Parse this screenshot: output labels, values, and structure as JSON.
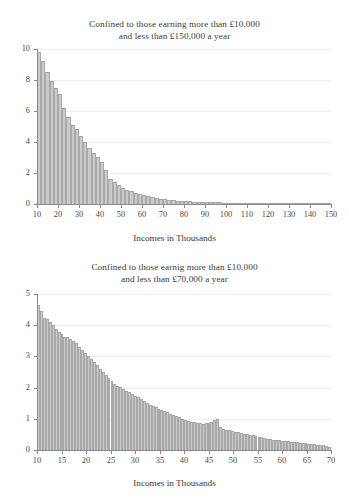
{
  "page": {
    "background": "#ffffff",
    "bar_fill": "#cbcbcb",
    "bar_edge": "#a3a3a3",
    "axis_color": "#8a8a8a",
    "grid_color": "#ededed",
    "text_color": "#3a3a3a"
  },
  "chart_data": [
    {
      "id": "income-histogram-150k",
      "type": "bar",
      "title": "Confined to those earning more than £10,000 and less than £150,000 a year",
      "title_lines": [
        "Confined to those earning more than £10,000",
        "and less than £150,000 a year"
      ],
      "xlabel": "Incomes in Thousands",
      "ylabel": "",
      "xlim": [
        10,
        150
      ],
      "ylim": [
        0,
        10
      ],
      "xticks": [
        10,
        20,
        30,
        40,
        50,
        60,
        70,
        80,
        90,
        100,
        110,
        120,
        130,
        140,
        150
      ],
      "xtick_labels": [
        "10",
        "20",
        "30",
        "40",
        "50",
        "60",
        "70",
        "80",
        "90",
        "100",
        "110",
        "120",
        "130",
        "140",
        "150"
      ],
      "yticks": [
        0,
        2,
        4,
        6,
        8,
        10
      ],
      "ytick_labels": [
        "0",
        "2",
        "4",
        "6",
        "8",
        "10"
      ],
      "grid": "horizontal",
      "legend": "none",
      "bin_width": 2,
      "bin_starts": [
        10,
        12,
        14,
        16,
        18,
        20,
        22,
        24,
        26,
        28,
        30,
        32,
        34,
        36,
        38,
        40,
        42,
        44,
        46,
        48,
        50,
        52,
        54,
        56,
        58,
        60,
        62,
        64,
        66,
        68,
        70,
        72,
        74,
        76,
        78,
        80,
        82,
        84,
        86,
        88,
        90,
        92,
        94,
        96,
        98,
        100,
        102,
        104,
        106,
        108,
        110,
        112,
        114,
        116,
        118,
        120,
        122,
        124,
        126,
        128,
        130,
        132,
        134,
        136,
        138,
        140,
        142,
        144,
        146,
        148
      ],
      "values": [
        9.8,
        9.2,
        8.5,
        7.9,
        7.5,
        7.1,
        6.2,
        5.6,
        5.1,
        4.8,
        4.4,
        4.0,
        3.6,
        3.3,
        3.0,
        2.7,
        2.2,
        1.6,
        1.4,
        1.2,
        1.05,
        0.92,
        0.8,
        0.7,
        0.62,
        0.55,
        0.48,
        0.43,
        0.38,
        0.34,
        0.3,
        0.27,
        0.24,
        0.21,
        0.19,
        0.17,
        0.155,
        0.14,
        0.13,
        0.12,
        0.11,
        0.1,
        0.092,
        0.085,
        0.078,
        0.072,
        0.066,
        0.061,
        0.057,
        0.053,
        0.049,
        0.045,
        0.042,
        0.039,
        0.036,
        0.034,
        0.031,
        0.029,
        0.027,
        0.025,
        0.023,
        0.022,
        0.02,
        0.019,
        0.018,
        0.017,
        0.016,
        0.015,
        0.014,
        0.013
      ],
      "annotation": "Spike near £42,000 reflecting the higher-rate tax threshold"
    },
    {
      "id": "income-histogram-70k",
      "type": "bar",
      "title": "Confined to those earnig more than £10,000 and less than £70,000 a year",
      "title_lines": [
        "Confined to those earnig more than £10,000",
        "and less than £70,000 a year"
      ],
      "xlabel": "Incomes in Thousands",
      "ylabel": "",
      "xlim": [
        10,
        70
      ],
      "ylim": [
        0,
        5
      ],
      "xticks": [
        10,
        15,
        20,
        25,
        30,
        35,
        40,
        45,
        50,
        55,
        60,
        65,
        70
      ],
      "xtick_labels": [
        "10",
        "15",
        "20",
        "25",
        "30",
        "35",
        "40",
        "45",
        "50",
        "55",
        "60",
        "65",
        "70"
      ],
      "yticks": [
        0,
        1,
        2,
        3,
        4,
        5
      ],
      "ytick_labels": [
        "0",
        "1",
        "2",
        "3",
        "4",
        "5"
      ],
      "grid": "horizontal",
      "legend": "none",
      "bin_width": 0.6,
      "bin_starts": [
        10.0,
        10.6,
        11.2,
        11.8,
        12.4,
        13.0,
        13.6,
        14.2,
        14.8,
        15.4,
        16.0,
        16.6,
        17.2,
        17.8,
        18.4,
        19.0,
        19.6,
        20.2,
        20.8,
        21.4,
        22.0,
        22.6,
        23.2,
        23.8,
        24.4,
        25.0,
        25.6,
        26.2,
        26.8,
        27.4,
        28.0,
        28.6,
        29.2,
        29.8,
        30.4,
        31.0,
        31.6,
        32.2,
        32.8,
        33.4,
        34.0,
        34.6,
        35.2,
        35.8,
        36.4,
        37.0,
        37.6,
        38.2,
        38.8,
        39.4,
        40.0,
        40.6,
        41.2,
        41.8,
        42.4,
        43.0,
        43.6,
        44.2,
        44.8,
        45.4,
        46.0,
        46.6,
        47.2,
        47.8,
        48.4,
        49.0,
        49.6,
        50.2,
        50.8,
        51.4,
        52.0,
        52.6,
        53.2,
        53.8,
        54.4,
        55.0,
        55.6,
        56.2,
        56.8,
        57.4,
        58.0,
        58.6,
        59.2,
        59.8,
        60.4,
        61.0,
        61.6,
        62.2,
        62.8,
        63.4,
        64.0,
        64.6,
        65.2,
        65.8,
        66.4,
        67.0,
        67.6,
        68.2,
        68.8,
        69.4
      ],
      "values": [
        4.65,
        4.45,
        4.22,
        4.2,
        4.1,
        4.0,
        3.88,
        3.78,
        3.7,
        3.62,
        3.6,
        3.55,
        3.5,
        3.42,
        3.3,
        3.2,
        3.1,
        3.0,
        2.92,
        2.8,
        2.72,
        2.6,
        2.5,
        2.4,
        2.3,
        2.22,
        2.12,
        2.05,
        2.0,
        1.95,
        1.9,
        1.85,
        1.8,
        1.74,
        1.68,
        1.62,
        1.56,
        1.5,
        1.45,
        1.4,
        1.36,
        1.32,
        1.28,
        1.24,
        1.2,
        1.16,
        1.12,
        1.08,
        1.04,
        1.0,
        0.96,
        0.93,
        0.9,
        0.88,
        0.86,
        0.85,
        0.84,
        0.85,
        0.87,
        0.9,
        0.95,
        1.0,
        0.72,
        0.68,
        0.65,
        0.62,
        0.6,
        0.58,
        0.56,
        0.54,
        0.52,
        0.5,
        0.48,
        0.46,
        0.44,
        0.42,
        0.4,
        0.38,
        0.36,
        0.35,
        0.33,
        0.32,
        0.3,
        0.29,
        0.28,
        0.27,
        0.26,
        0.25,
        0.24,
        0.23,
        0.22,
        0.21,
        0.2,
        0.19,
        0.18,
        0.17,
        0.16,
        0.15,
        0.13,
        0.1
      ],
      "annotation": "Spike near £42,000 reflecting the higher-rate tax threshold"
    }
  ]
}
